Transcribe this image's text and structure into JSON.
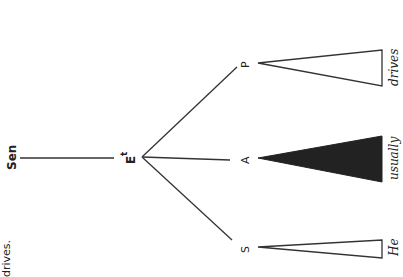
{
  "diagram": {
    "orientation": "rotated-90-ccw",
    "root": {
      "label": "Sen"
    },
    "node": {
      "label": "E",
      "superscript": "t"
    },
    "children": [
      {
        "label": "P",
        "word": "drives",
        "triangle": "outline"
      },
      {
        "label": "A",
        "word": "usually",
        "triangle": "filled"
      },
      {
        "label": "S",
        "word": "He",
        "triangle": "outline"
      }
    ],
    "caption_fragment": "drives."
  }
}
